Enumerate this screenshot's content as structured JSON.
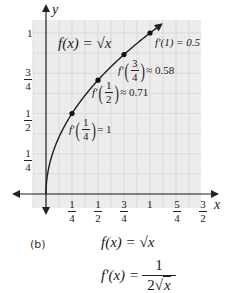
{
  "chart_data": {
    "type": "line",
    "title": "f(x) = √x",
    "xlabel": "x",
    "ylabel": "y",
    "xlim": [
      0,
      1.6
    ],
    "ylim": [
      0,
      1.15
    ],
    "grid": true,
    "x_ticks": [
      "1/4",
      "1/2",
      "3/4",
      "1",
      "5/4",
      "3/2"
    ],
    "y_ticks": [
      "1/4",
      "1/2",
      "3/4",
      "1"
    ],
    "series": [
      {
        "name": "f(x) = √x",
        "x": [
          0,
          0.0625,
          0.125,
          0.25,
          0.375,
          0.5,
          0.625,
          0.75,
          0.875,
          1.0,
          1.1
        ],
        "values": [
          0,
          0.25,
          0.354,
          0.5,
          0.612,
          0.707,
          0.791,
          0.866,
          0.935,
          1.0,
          1.049
        ]
      }
    ],
    "marked_points": [
      {
        "x": 0.25,
        "y": 0.5,
        "label": "f'(1/4) = 1"
      },
      {
        "x": 0.5,
        "y": 0.707,
        "label": "f'(1/2) ≈ 0.71"
      },
      {
        "x": 0.75,
        "y": 0.866,
        "label": "f'(3/4) ≈ 0.58"
      },
      {
        "x": 1.0,
        "y": 1.0,
        "label": "f'(1) = 0.5"
      }
    ],
    "annotations": [
      "f(x) = √x",
      "f'(1) = 0.5",
      "f'(3/4) ≈ 0.58",
      "f'(1/2) ≈ 0.71",
      "f'(1/4) = 1"
    ]
  },
  "axis": {
    "x_label": "x",
    "y_label": "y",
    "x_ticks": [
      {
        "num": "1",
        "den": "4"
      },
      {
        "num": "1",
        "den": "2"
      },
      {
        "num": "3",
        "den": "4"
      },
      {
        "num": "1",
        "den": ""
      },
      {
        "num": "5",
        "den": "4"
      },
      {
        "num": "3",
        "den": "2"
      }
    ],
    "y_ticks": [
      {
        "num": "1",
        "den": "4"
      },
      {
        "num": "1",
        "den": "2"
      },
      {
        "num": "3",
        "den": "4"
      },
      {
        "num": "1",
        "den": ""
      }
    ]
  },
  "annotations": {
    "function_label": "f(x) = √x",
    "d1": {
      "prefix": "f′(1) = 0.5"
    },
    "d34": {
      "prefix": "f′",
      "num": "3",
      "den": "4",
      "suffix": "≈ 0.58"
    },
    "d12": {
      "prefix": "f′",
      "num": "1",
      "den": "2",
      "suffix": "≈ 0.71"
    },
    "d14": {
      "prefix": "f′",
      "num": "1",
      "den": "4",
      "suffix": "= 1"
    }
  },
  "caption": {
    "label": "(b)",
    "eq1": "f(x) = √x",
    "eq2_lhs": "f′(x) =",
    "eq2_num": "1",
    "eq2_den_coef": "2",
    "eq2_den_rad": "x"
  },
  "colors": {
    "grid_bg": "#ececec",
    "grid_line": "#d4d4d4",
    "axis": "#222222",
    "curve": "#1f1f1f"
  }
}
